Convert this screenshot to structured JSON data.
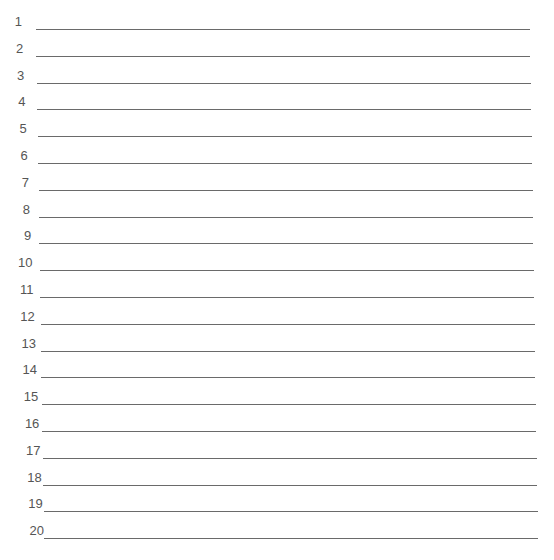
{
  "form": {
    "type": "numbered-lined-sheet",
    "line_color": "#6a6a6a",
    "label_color": "#555555",
    "rows": [
      {
        "label": "1",
        "value": ""
      },
      {
        "label": "2",
        "value": ""
      },
      {
        "label": "3",
        "value": ""
      },
      {
        "label": "4",
        "value": ""
      },
      {
        "label": "5",
        "value": ""
      },
      {
        "label": "6",
        "value": ""
      },
      {
        "label": "7",
        "value": ""
      },
      {
        "label": "8",
        "value": ""
      },
      {
        "label": "9",
        "value": ""
      },
      {
        "label": "10",
        "value": ""
      },
      {
        "label": "11",
        "value": ""
      },
      {
        "label": "12",
        "value": ""
      },
      {
        "label": "13",
        "value": ""
      },
      {
        "label": "14",
        "value": ""
      },
      {
        "label": "15",
        "value": ""
      },
      {
        "label": "16",
        "value": ""
      },
      {
        "label": "17",
        "value": ""
      },
      {
        "label": "18",
        "value": ""
      },
      {
        "label": "19",
        "value": ""
      },
      {
        "label": "20",
        "value": ""
      }
    ]
  }
}
